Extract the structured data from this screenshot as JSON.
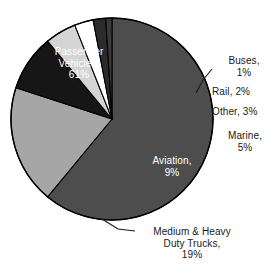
{
  "chart_data": {
    "type": "pie",
    "title": "",
    "subtitle": "",
    "xlabel": "",
    "ylabel": "",
    "legend_position": "none",
    "grid": false,
    "units": "percent",
    "categories": [
      "Passenger Vehicles",
      "Buses",
      "Rail",
      "Other",
      "Marine",
      "Aviation",
      "Medium & Heavy Duty Trucks"
    ],
    "values": [
      61,
      1,
      2,
      3,
      5,
      9,
      19
    ],
    "slices": [
      {
        "name": "Passenger Vehicles",
        "value": 61,
        "value_text": "61%",
        "label_lines": [
          "Passenger",
          "Vehicles,",
          "61%"
        ],
        "color": "#4d4d4d",
        "text_color": "#ffffff",
        "label_placement": "inside",
        "leader_line": false
      },
      {
        "name": "Buses",
        "value": 1,
        "value_text": "1%",
        "label_lines": [
          "Buses,",
          "1%"
        ],
        "color": "#3a3a3a",
        "text_color": "#1a1a1a",
        "label_placement": "outside",
        "leader_line": true
      },
      {
        "name": "Rail",
        "value": 2,
        "value_text": "2%",
        "label_lines": [
          "Rail, 2%"
        ],
        "color": "#2b2b2b",
        "text_color": "#1a1a1a",
        "label_placement": "outside",
        "leader_line": false
      },
      {
        "name": "Other",
        "value": 3,
        "value_text": "3%",
        "label_lines": [
          "Other, 3%"
        ],
        "color": "#ffffff",
        "text_color": "#1a1a1a",
        "label_placement": "outside",
        "leader_line": false
      },
      {
        "name": "Marine",
        "value": 5,
        "value_text": "5%",
        "label_lines": [
          "Marine,",
          "5%"
        ],
        "color": "#d4d4d4",
        "text_color": "#1a1a1a",
        "label_placement": "outside",
        "leader_line": false
      },
      {
        "name": "Aviation",
        "value": 9,
        "value_text": "9%",
        "label_lines": [
          "Aviation,",
          "9%"
        ],
        "color": "#161616",
        "text_color": "#ffffff",
        "label_placement": "inside",
        "leader_line": false
      },
      {
        "name": "Medium & Heavy Duty Trucks",
        "value": 19,
        "value_text": "19%",
        "label_lines": [
          "Medium & Heavy",
          "Duty Trucks,",
          "19%"
        ],
        "color": "#a6a6a6",
        "text_color": "#1a1a1a",
        "label_placement": "outside",
        "leader_line": true
      }
    ]
  },
  "labels": {
    "passenger": "Passenger\nVehicles,\n61%",
    "aviation": "Aviation,\n9%",
    "trucks": "Medium & Heavy\nDuty Trucks,\n19%",
    "buses": "Buses,\n1%",
    "rail": "Rail, 2%",
    "other": "Other, 3%",
    "marine": "Marine,\n5%"
  },
  "colors": {
    "background": "#ffffff",
    "outline": "#000000",
    "passenger_vehicles": "#4d4d4d",
    "buses": "#3a3a3a",
    "rail": "#2b2b2b",
    "other": "#ffffff",
    "marine": "#d4d4d4",
    "aviation": "#161616",
    "trucks": "#a6a6a6",
    "label_text": "#1a1a1a",
    "inner_label_text": "#ffffff"
  }
}
